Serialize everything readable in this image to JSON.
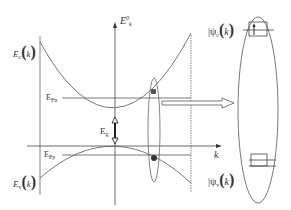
{
  "diagram": {
    "type": "band-diagram",
    "axes": {
      "energy_axis_label": "E",
      "energy_axis_sup": "0",
      "energy_axis_sub": "k",
      "momentum_axis_label": "k"
    },
    "bands": {
      "conduction": {
        "label": "E",
        "label_sub": "c",
        "arg": "k"
      },
      "valence": {
        "label": "E",
        "label_sub": "v",
        "arg": "k"
      }
    },
    "levels": {
      "fermi_n": {
        "label": "E",
        "label_sub": "Fn"
      },
      "fermi_p": {
        "label": "E",
        "label_sub": "Fp"
      },
      "gap": {
        "label": "E",
        "label_sub": "g"
      }
    },
    "states": {
      "upper": {
        "label_prefix": "|ψ",
        "label_sub": "c",
        "arg": "k"
      },
      "lower": {
        "label_prefix": "|ψ",
        "label_sub": "v",
        "arg": "k"
      }
    },
    "colors": {
      "line": "#555555",
      "dark": "#222222",
      "dot": "#444444"
    }
  }
}
